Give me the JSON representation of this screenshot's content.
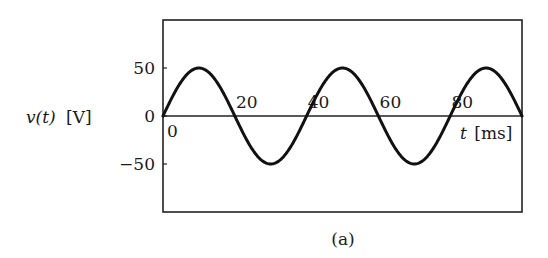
{
  "chart_data": {
    "type": "line",
    "title": "",
    "caption": "(a)",
    "xlabel": "t [ms]",
    "ylabel": "v(t) [V]",
    "xlabel_var": "t",
    "xlabel_unit": "[ms]",
    "ylabel_var": "v(t)",
    "ylabel_unit": "[V]",
    "xlim": [
      0,
      100
    ],
    "ylim": [
      -96,
      96
    ],
    "x_ticks": [
      0,
      20,
      40,
      60,
      80
    ],
    "x_tick_labels": [
      "0",
      "20",
      "40",
      "60",
      "80"
    ],
    "y_ticks": [
      50,
      0,
      -50
    ],
    "y_tick_labels": [
      "50",
      "0",
      "−50"
    ],
    "grid": false,
    "legend": null,
    "series": [
      {
        "name": "v(t)",
        "function": "50 sin(2π t / 40)",
        "amplitude": 50,
        "period_ms": 40,
        "x": [
          0,
          5,
          10,
          15,
          20,
          25,
          30,
          35,
          40,
          45,
          50,
          55,
          60,
          65,
          70,
          75,
          80,
          85,
          90,
          95,
          100
        ],
        "values": [
          0,
          35.4,
          50,
          35.4,
          0,
          -35.4,
          -50,
          -35.4,
          0,
          35.4,
          50,
          35.4,
          0,
          -35.4,
          -50,
          -35.4,
          0,
          35.4,
          50,
          35.4,
          0
        ]
      }
    ]
  },
  "labels": {
    "caption": "(a)",
    "ylabel_var": "v(t)",
    "ylabel_unit": "[V]",
    "xlabel_var": "t",
    "xlabel_unit": "[ms]",
    "origin": "0"
  },
  "colors": {
    "line": "#111111",
    "axis": "#222222",
    "background": "#ffffff"
  }
}
